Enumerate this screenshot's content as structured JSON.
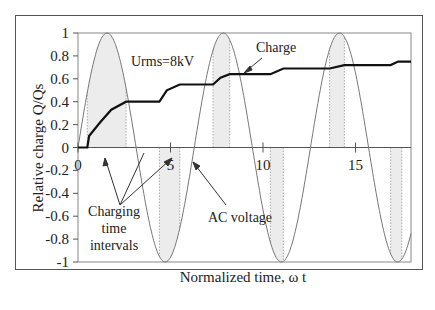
{
  "chart_data": {
    "type": "line",
    "title": "",
    "xlabel": "Normalized time, ω t",
    "ylabel": "Relative charge Q/Qs",
    "xlim": [
      0,
      18
    ],
    "ylim": [
      -1,
      1
    ],
    "x_ticks": [
      "0",
      "5",
      "10",
      "15"
    ],
    "y_ticks": [
      "1",
      "0.8",
      "0.6",
      "0.4",
      "0.2",
      "0",
      "-0.2",
      "-0.4",
      "-0.6",
      "-0.8",
      "-1"
    ],
    "grid": false,
    "series": [
      {
        "name": "AC voltage",
        "function": "sin(x)",
        "style": "thin gray"
      },
      {
        "name": "Charge",
        "style": "thick black",
        "x": [
          0,
          0.5,
          0.6,
          1.2,
          1.8,
          2.6,
          4.4,
          4.8,
          5.5,
          7.3,
          7.7,
          8.2,
          10.4,
          11.1,
          13.6,
          14.4,
          16.9,
          17.3,
          18
        ],
        "y": [
          0,
          0,
          0.1,
          0.22,
          0.33,
          0.4,
          0.4,
          0.5,
          0.55,
          0.55,
          0.61,
          0.64,
          0.64,
          0.69,
          0.69,
          0.72,
          0.72,
          0.75,
          0.75
        ]
      }
    ],
    "shaded_intervals": [
      [
        0.5,
        2.6
      ],
      [
        4.4,
        5.5
      ],
      [
        7.3,
        8.2
      ],
      [
        10.4,
        11.1
      ],
      [
        13.6,
        14.4
      ],
      [
        16.9,
        17.5
      ]
    ],
    "annotations": [
      {
        "text": "Urms=8kV"
      },
      {
        "text": "Charge"
      },
      {
        "text": "Charging"
      },
      {
        "text": "time"
      },
      {
        "text": "intervals"
      },
      {
        "text": "AC voltage"
      }
    ]
  },
  "labels": {
    "xlabel": "Normalized time, ω t",
    "ylabel": "Relative charge Q/Qs",
    "urms": "Urms=8kV",
    "charge": "Charge",
    "charging1": "Charging",
    "charging2": "time",
    "charging3": "intervals",
    "ac": "AC voltage"
  }
}
